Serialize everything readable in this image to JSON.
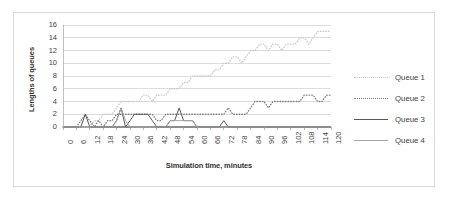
{
  "figure": {
    "background": "#ffffff",
    "border_color": "#d9d9d9"
  },
  "legend": {
    "position": "right",
    "items": [
      {
        "label": "Queue 1",
        "color": "#c9c9c9",
        "style": "dotted"
      },
      {
        "label": "Queue 2",
        "color": "#7f7f7f",
        "style": "dotted"
      },
      {
        "label": "Queue 3",
        "color": "#595959",
        "style": "solid"
      },
      {
        "label": "Queue 4",
        "color": "#a6a6a6",
        "style": "solid"
      }
    ]
  },
  "chart_data": {
    "type": "line",
    "title": "",
    "xlabel": "Simulation time, minutes",
    "ylabel": "Lengths of queues",
    "xlim": [
      0,
      120
    ],
    "ylim": [
      0,
      16
    ],
    "grid": true,
    "yticks": [
      0,
      2,
      4,
      6,
      8,
      10,
      12,
      14,
      16
    ],
    "xticks": [
      0,
      6,
      12,
      18,
      24,
      30,
      36,
      42,
      48,
      54,
      60,
      66,
      72,
      78,
      84,
      90,
      96,
      102,
      108,
      114,
      120
    ],
    "x": [
      0,
      2,
      4,
      6,
      8,
      10,
      12,
      14,
      16,
      18,
      20,
      22,
      24,
      26,
      28,
      30,
      32,
      34,
      36,
      38,
      40,
      42,
      44,
      46,
      48,
      50,
      52,
      54,
      56,
      58,
      60,
      62,
      64,
      66,
      68,
      70,
      72,
      74,
      76,
      78,
      80,
      82,
      84,
      86,
      88,
      90,
      92,
      94,
      96,
      98,
      100,
      102,
      104,
      106,
      108,
      110,
      112,
      114,
      116,
      118,
      120
    ],
    "series": [
      {
        "name": "Queue 1",
        "color": "#c9c9c9",
        "style": "dotted",
        "values": [
          0,
          0,
          0,
          0,
          0,
          0,
          0,
          1,
          1,
          2,
          2,
          2,
          3,
          4,
          4,
          4,
          4,
          4,
          5,
          5,
          4,
          5,
          5,
          5,
          6,
          6,
          6,
          7,
          7,
          8,
          8,
          8,
          8,
          8,
          9,
          9,
          10,
          10,
          11,
          11,
          10,
          11,
          12,
          12,
          13,
          13,
          12,
          13,
          13,
          12,
          13,
          13,
          13,
          14,
          14,
          13,
          14,
          15,
          15,
          15,
          15
        ]
      },
      {
        "name": "Queue 2",
        "color": "#7f7f7f",
        "style": "dotted",
        "values": [
          0,
          0,
          0,
          0,
          1,
          2,
          1,
          0,
          1,
          0,
          1,
          1,
          2,
          2,
          2,
          2,
          2,
          2,
          2,
          2,
          2,
          1,
          1,
          2,
          2,
          2,
          2,
          2,
          2,
          2,
          2,
          2,
          2,
          2,
          2,
          2,
          2,
          3,
          2,
          2,
          2,
          2,
          3,
          4,
          4,
          4,
          3,
          4,
          4,
          4,
          4,
          4,
          4,
          4,
          5,
          5,
          5,
          4,
          4,
          5,
          5
        ]
      },
      {
        "name": "Queue 3",
        "color": "#595959",
        "style": "solid",
        "values": [
          0,
          0,
          0,
          0,
          0,
          2,
          0,
          0,
          0,
          0,
          0,
          0,
          1,
          3,
          0,
          1,
          2,
          2,
          2,
          2,
          1,
          0,
          0,
          0,
          1,
          1,
          3,
          1,
          1,
          1,
          0,
          0,
          0,
          0,
          0,
          0,
          1,
          0,
          0,
          0,
          0,
          0,
          0,
          0,
          0,
          0,
          0,
          0,
          0,
          0,
          0,
          0,
          0,
          0,
          0,
          0,
          0,
          0,
          0,
          0,
          0
        ]
      },
      {
        "name": "Queue 4",
        "color": "#a6a6a6",
        "style": "solid",
        "values": [
          0,
          0,
          0,
          0,
          0,
          0,
          0,
          0,
          0,
          0,
          0,
          0,
          1,
          3,
          1,
          0,
          0,
          0,
          0,
          0,
          0,
          0,
          0,
          0,
          1,
          1,
          1,
          1,
          1,
          1,
          0,
          0,
          0,
          0,
          0,
          0,
          0,
          0,
          0,
          0,
          0,
          0,
          0,
          0,
          0,
          0,
          0,
          0,
          0,
          0,
          0,
          0,
          0,
          0,
          0,
          0,
          0,
          0,
          0,
          0,
          0
        ]
      }
    ]
  }
}
